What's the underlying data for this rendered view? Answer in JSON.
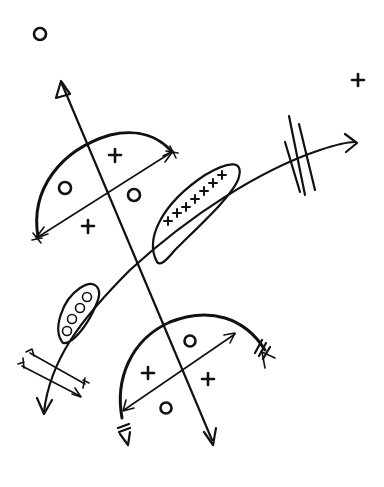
{
  "diagram": {
    "type": "hand-drawn geometric/vector diagram",
    "background": "#ffffff",
    "ink_color": "#111111",
    "stray_symbols": [
      {
        "symbol": "circle",
        "x": 40,
        "y": 34
      },
      {
        "symbol": "plus",
        "x": 358,
        "y": 80
      }
    ],
    "upper_semicircle": {
      "symbols": [
        {
          "symbol": "plus",
          "x": 115,
          "y": 155
        },
        {
          "symbol": "circle",
          "x": 65,
          "y": 188
        },
        {
          "symbol": "circle",
          "x": 134,
          "y": 195
        },
        {
          "symbol": "plus",
          "x": 88,
          "y": 226
        }
      ]
    },
    "plus_ellipse": {
      "count": 7,
      "symbol": "plus"
    },
    "circle_ellipse": {
      "count": 4,
      "symbol": "circle"
    },
    "lower_semicircle": {
      "symbols": [
        {
          "symbol": "circle",
          "x": 190,
          "y": 341
        },
        {
          "symbol": "plus",
          "x": 148,
          "y": 373
        },
        {
          "symbol": "plus",
          "x": 208,
          "y": 379
        },
        {
          "symbol": "circle",
          "x": 166,
          "y": 408
        }
      ]
    },
    "tick_marks": {
      "main_curve": 3,
      "lower_arc_end": 3,
      "lower_arc_start": 2
    }
  }
}
